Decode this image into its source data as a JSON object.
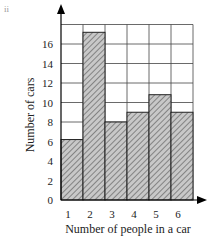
{
  "figure_label": "ii",
  "chart_data": {
    "type": "bar",
    "title": "",
    "xlabel": "Number of people in a car",
    "ylabel": "Number of cars",
    "categories": [
      "1",
      "2",
      "3",
      "4",
      "5",
      "6"
    ],
    "values": [
      6.2,
      17.2,
      8,
      9,
      10.8,
      9
    ],
    "ylim": [
      0,
      18
    ],
    "yticks": [
      0,
      2,
      4,
      6,
      8,
      10,
      12,
      14,
      16
    ],
    "grid": true,
    "bar_style": "hatched grey, no gaps (histogram)",
    "colors": {
      "bar_fill": "#c8c8c8",
      "hatch": "#555555",
      "grid": "#444444"
    }
  }
}
